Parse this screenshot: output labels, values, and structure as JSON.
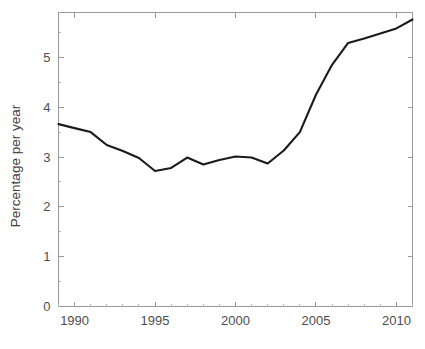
{
  "chart_data": {
    "type": "line",
    "title": "",
    "subtitle": "",
    "xlabel": "",
    "ylabel": "Percentage per year",
    "xlim": [
      1989,
      2011
    ],
    "ylim": [
      0,
      5.9
    ],
    "grid": false,
    "legend": null,
    "legend_position": "none",
    "x_ticks": [
      1990,
      1995,
      2000,
      2005,
      2010
    ],
    "x_tick_labels": [
      "1990",
      "1995",
      "2000",
      "2005",
      "2010"
    ],
    "x_minor_ticks": [
      1989,
      1991,
      1992,
      1993,
      1994,
      1996,
      1997,
      1998,
      1999,
      2001,
      2002,
      2003,
      2004,
      2006,
      2007,
      2008,
      2009,
      2011
    ],
    "y_ticks": [
      0,
      1,
      2,
      3,
      4,
      5
    ],
    "y_tick_labels": [
      "0",
      "1",
      "2",
      "3",
      "4",
      "5"
    ],
    "y_minor_ticks": [
      0.5,
      1.5,
      2.5,
      3.5,
      4.5,
      5.5
    ],
    "series": [
      {
        "name": "Percentage per year",
        "color": "#1a1a1a",
        "x": [
          1989,
          1990,
          1991,
          1992,
          1993,
          1994,
          1995,
          1996,
          1997,
          1998,
          1999,
          2000,
          2001,
          2002,
          2003,
          2004,
          2005,
          2006,
          2007,
          2008,
          2009,
          2010,
          2011
        ],
        "values": [
          3.66,
          3.58,
          3.5,
          3.24,
          3.12,
          2.98,
          2.72,
          2.78,
          2.99,
          2.85,
          2.94,
          3.01,
          2.99,
          2.87,
          3.13,
          3.5,
          4.25,
          4.85,
          5.29,
          5.38,
          5.48,
          5.58,
          5.76
        ]
      }
    ]
  },
  "axis_labels": {
    "y_axis_title": "Percentage per year"
  },
  "colors": {
    "line": "#1a1a1a",
    "axis": "#9a9a9a",
    "tick_text": "#4d4d4d",
    "background": "#ffffff"
  }
}
